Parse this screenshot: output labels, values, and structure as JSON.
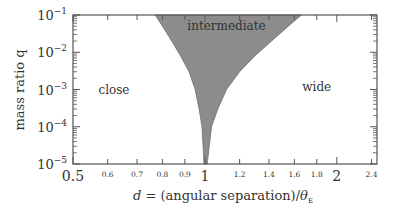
{
  "chart_data": {
    "type": "area",
    "title": "",
    "xlabel": "d = (angular separation)/θE",
    "xlabel_parts": {
      "var": "d",
      "eq": " = (angular separation)/",
      "theta": "θ",
      "sub": "E"
    },
    "ylabel": "mass ratio q",
    "xscale": "log",
    "yscale": "log",
    "xlim": [
      0.5,
      2.47
    ],
    "ylim": [
      1e-05,
      0.1
    ],
    "grid": false,
    "x_major_ticks": [
      {
        "value": 0.5,
        "label": "0.5"
      },
      {
        "value": 1,
        "label": "1"
      },
      {
        "value": 2,
        "label": "2"
      }
    ],
    "x_minor_ticks": [
      {
        "value": 0.6,
        "label": "0.6"
      },
      {
        "value": 0.7,
        "label": "0.7"
      },
      {
        "value": 0.8,
        "label": "0.8"
      },
      {
        "value": 0.9,
        "label": "0.9"
      },
      {
        "value": 1.2,
        "label": "1.2"
      },
      {
        "value": 1.4,
        "label": "1.4"
      },
      {
        "value": 1.6,
        "label": "1.6"
      },
      {
        "value": 1.8,
        "label": "1.8"
      },
      {
        "value": 2.4,
        "label": "2.4"
      }
    ],
    "y_ticks": [
      {
        "exp": -1,
        "label_base": "10",
        "label_exp": "−1"
      },
      {
        "exp": -2,
        "label_base": "10",
        "label_exp": "−2"
      },
      {
        "exp": -3,
        "label_base": "10",
        "label_exp": "−3"
      },
      {
        "exp": -4,
        "label_base": "10",
        "label_exp": "−4"
      },
      {
        "exp": -5,
        "label_base": "10",
        "label_exp": "−5"
      }
    ],
    "regions": [
      {
        "name": "close",
        "label": "close",
        "x": 0.62,
        "q": 0.001
      },
      {
        "name": "intermediate",
        "label": "intermediate",
        "x": 1.12,
        "q": 0.05
      },
      {
        "name": "wide",
        "label": "wide",
        "x": 1.8,
        "q": 0.0012
      }
    ],
    "series": [
      {
        "name": "close/intermediate boundary",
        "x": [
          0.77,
          0.8,
          0.84,
          0.88,
          0.92,
          0.95,
          0.97,
          0.985,
          0.995
        ],
        "q": [
          0.1,
          0.05,
          0.02,
          0.008,
          0.003,
          0.001,
          0.0003,
          0.0001,
          1e-05
        ]
      },
      {
        "name": "intermediate/wide boundary",
        "x": [
          1.66,
          1.55,
          1.42,
          1.3,
          1.2,
          1.12,
          1.07,
          1.035,
          1.012
        ],
        "q": [
          0.1,
          0.05,
          0.02,
          0.008,
          0.003,
          0.001,
          0.0003,
          0.0001,
          1e-05
        ]
      }
    ],
    "fill_color": "#8c8c8c",
    "axis_color": "#555555"
  }
}
